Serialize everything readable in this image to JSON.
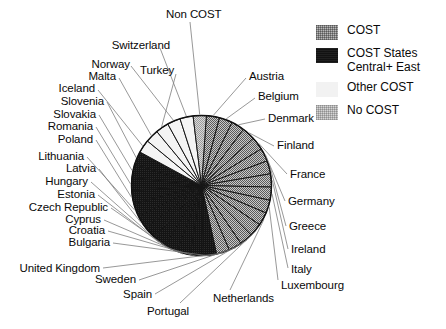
{
  "legend": {
    "items": [
      {
        "label": "COST",
        "swatch": "cost",
        "color": "#b9b9b9"
      },
      {
        "label": "COST States\nCentral+ East",
        "swatch": "east",
        "color": "#121212"
      },
      {
        "label": "Other COST",
        "swatch": "other",
        "color": "#f2f2f2"
      },
      {
        "label": "No COST",
        "swatch": "nocost",
        "color": "#d6d6d6"
      }
    ]
  },
  "chart_data": {
    "type": "pie",
    "title": "",
    "xlabel": "",
    "ylabel": "",
    "legend_position": "top-right",
    "grid": false,
    "note": "All slices are equal sized (one slice per country). Categories grouped by COST membership class.",
    "categories": [
      "Austria",
      "Belgium",
      "Denmark",
      "Finland",
      "France",
      "Germany",
      "Greece",
      "Ireland",
      "Italy",
      "Luxembourg",
      "Netherlands",
      "Portugal",
      "Spain",
      "Sweden",
      "United Kingdom",
      "Bulgaria",
      "Croatia",
      "Cyprus",
      "Czech Republic",
      "Estonia",
      "Hungary",
      "Latvia",
      "Lithuania",
      "Poland",
      "Romania",
      "Slovakia",
      "Slovenia",
      "Iceland",
      "Malta",
      "Norway",
      "Switzerland",
      "Turkey",
      "Non COST"
    ],
    "values": [
      1,
      1,
      1,
      1,
      1,
      1,
      1,
      1,
      1,
      1,
      1,
      1,
      1,
      1,
      1,
      1,
      1,
      1,
      1,
      1,
      1,
      1,
      1,
      1,
      1,
      1,
      1,
      1,
      1,
      1,
      1,
      1,
      1
    ],
    "series": [
      {
        "name": "Countries",
        "groups": [
          {
            "group": "COST",
            "swatch": "cost",
            "color": "#b9b9b9",
            "members": [
              "Austria",
              "Belgium",
              "Denmark",
              "Finland",
              "France",
              "Germany",
              "Greece",
              "Ireland",
              "Italy",
              "Luxembourg",
              "Netherlands",
              "Portugal",
              "Spain",
              "Sweden",
              "United Kingdom"
            ],
            "count": 15
          },
          {
            "group": "COST States Central+ East",
            "swatch": "east",
            "color": "#121212",
            "members": [
              "Bulgaria",
              "Croatia",
              "Cyprus",
              "Czech Republic",
              "Estonia",
              "Hungary",
              "Latvia",
              "Lithuania",
              "Poland",
              "Romania",
              "Slovakia",
              "Slovenia"
            ],
            "count": 12
          },
          {
            "group": "Other COST",
            "swatch": "other",
            "color": "#f2f2f2",
            "members": [
              "Iceland",
              "Malta",
              "Norway",
              "Switzerland",
              "Turkey"
            ],
            "count": 5
          },
          {
            "group": "No COST",
            "swatch": "nocost",
            "color": "#d6d6d6",
            "members": [
              "Non COST"
            ],
            "count": 1
          }
        ]
      }
    ]
  },
  "labels": {
    "non_cost": "Non COST",
    "switzerland": "Switzerland",
    "norway": "Norway",
    "malta": "Malta",
    "turkey": "Turkey",
    "iceland": "Iceland",
    "slovenia": "Slovenia",
    "slovakia": "Slovakia",
    "romania": "Romania",
    "poland": "Poland",
    "lithuania": "Lithuania",
    "latvia": "Latvia",
    "hungary": "Hungary",
    "estonia": "Estonia",
    "czech_republic": "Czech Republic",
    "cyprus": "Cyprus",
    "croatia": "Croatia",
    "bulgaria": "Bulgaria",
    "united_kingdom": "United Kingdom",
    "sweden": "Sweden",
    "spain": "Spain",
    "portugal": "Portugal",
    "netherlands": "Netherlands",
    "luxembourg": "Luxembourg",
    "italy": "Italy",
    "ireland": "Ireland",
    "greece": "Greece",
    "germany": "Germany",
    "france": "France",
    "finland": "Finland",
    "denmark": "Denmark",
    "belgium": "Belgium",
    "austria": "Austria"
  }
}
